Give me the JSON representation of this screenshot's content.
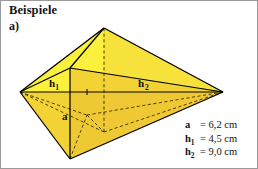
{
  "page": {
    "heading": "Beispiele",
    "item_label": "a)",
    "border_color": "#9a9a9a",
    "background": "#ffffff"
  },
  "figure": {
    "name": "double-pyramid-over-kite-base",
    "colors": {
      "face_light": "#fbf13c",
      "face_mid": "#f7e23b",
      "face_dark": "#f3d236",
      "face_darker": "#efc933",
      "edge": "#000000",
      "hidden_edge": "#3a3000",
      "axis_line": "#000000"
    },
    "labels": [
      {
        "name": "height-label-h1",
        "text": "h",
        "sub": "1",
        "x": 48,
        "y": 77
      },
      {
        "name": "height-label-h2",
        "text": "h",
        "sub": "2",
        "x": 137,
        "y": 77
      },
      {
        "name": "edge-label-a",
        "text": "a",
        "sub": "",
        "x": 61,
        "y": 110
      }
    ],
    "vertices": {
      "left": [
        19,
        91
      ],
      "right": [
        222,
        91
      ],
      "top_apex": [
        103,
        27
      ],
      "bottom_apex": [
        69,
        158
      ],
      "front": [
        69,
        91
      ],
      "center": [
        103,
        91
      ],
      "center_tick": [
        86,
        91
      ]
    }
  },
  "legend": {
    "name": "measurements-legend",
    "rows": [
      {
        "symbol": "a",
        "subscript": "",
        "value": "= 6,2 cm"
      },
      {
        "symbol": "h",
        "subscript": "1",
        "value": "= 4,5 cm"
      },
      {
        "symbol": "h",
        "subscript": "2",
        "value": "= 9,0 cm"
      }
    ]
  }
}
